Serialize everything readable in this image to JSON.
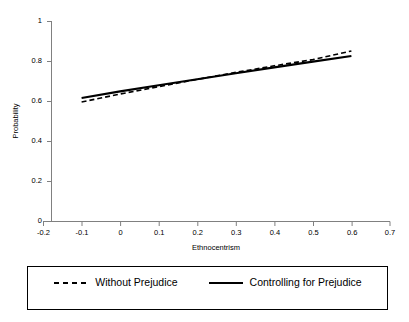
{
  "chart_data": {
    "type": "line",
    "title": "",
    "xlabel": "Ethnocentrism",
    "ylabel": "Probability",
    "xlim": [
      -0.2,
      0.7
    ],
    "ylim": [
      0,
      1
    ],
    "grid": false,
    "legend_position": "bottom",
    "x_ticks": [
      "-0.2",
      "-0.1",
      "0",
      "0.1",
      "0.2",
      "0.3",
      "0.4",
      "0.5",
      "0.6",
      "0.7"
    ],
    "x_tick_values": [
      -0.2,
      -0.1,
      0,
      0.1,
      0.2,
      0.3,
      0.4,
      0.5,
      0.6,
      0.7
    ],
    "y_ticks": [
      "0",
      "0.2",
      "0.4",
      "0.6",
      "0.8",
      "1"
    ],
    "y_tick_values": [
      0,
      0.2,
      0.4,
      0.6,
      0.8,
      1
    ],
    "x": [
      -0.1,
      0.0,
      0.1,
      0.2,
      0.3,
      0.4,
      0.5,
      0.6
    ],
    "series": [
      {
        "name": "Without Prejudice",
        "style": "dashed",
        "color": "#000000",
        "values": [
          0.595,
          0.635,
          0.672,
          0.708,
          0.743,
          0.776,
          0.807,
          0.85
        ]
      },
      {
        "name": "Controlling for Prejudice",
        "style": "solid",
        "color": "#000000",
        "values": [
          0.615,
          0.648,
          0.679,
          0.709,
          0.739,
          0.768,
          0.797,
          0.825
        ]
      }
    ]
  },
  "legend": {
    "entries": [
      {
        "label": "Without Prejudice",
        "style": "dashed"
      },
      {
        "label": "Controlling for Prejudice",
        "style": "solid"
      }
    ]
  },
  "axes": {
    "x_title": "Ethnocentrism",
    "y_title": "Probability"
  }
}
